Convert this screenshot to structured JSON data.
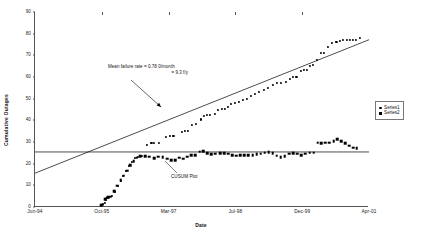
{
  "chart_data": {
    "type": "scatter",
    "title": "",
    "xlabel": "Date",
    "ylabel": "Cumulative Outages",
    "ylim": [
      0,
      90
    ],
    "yticks": [
      0,
      10,
      20,
      30,
      40,
      50,
      60,
      70,
      80,
      90
    ],
    "xticks": [
      "Jun-94",
      "Oct-95",
      "Mar-97",
      "Jul-98",
      "Dec-99",
      "Apr-01"
    ],
    "xlim_months": [
      0,
      82
    ],
    "grid": false,
    "legend_position": "right",
    "legend": [
      "Series1",
      "Series2"
    ],
    "annotations": [
      {
        "name": "mean-failure-rate",
        "line1": "Mean failure rate = 0.78 0/month",
        "line2": "= 9.3 f/y",
        "arrow_from": [
          130,
          80
        ],
        "arrow_to": [
          160,
          107
        ]
      },
      {
        "name": "cusum-plot-label",
        "line1": "CUSUM Plot",
        "leader_from": [
          176,
          173
        ],
        "leader_to": [
          164,
          161
        ]
      }
    ],
    "series": [
      {
        "name": "Series1",
        "marker": "dot",
        "color": "#000000",
        "points": [
          [
            16.3,
            0.8
          ],
          [
            16.6,
            1.2
          ],
          [
            17.1,
            2.0
          ],
          [
            17.4,
            3.4
          ],
          [
            17.8,
            4.0
          ],
          [
            18.2,
            4.6
          ],
          [
            18.9,
            5.2
          ],
          [
            19.6,
            7.0
          ],
          [
            20.3,
            9.8
          ],
          [
            21.0,
            12.2
          ],
          [
            21.7,
            14.4
          ],
          [
            22.4,
            16.6
          ],
          [
            23.1,
            19.0
          ],
          [
            23.8,
            21.0
          ],
          [
            24.5,
            22.6
          ],
          [
            25.2,
            23.3
          ],
          [
            26.3,
            23.6
          ],
          [
            27.4,
            28.6
          ],
          [
            28.6,
            29.5
          ],
          [
            29.3,
            29.6
          ],
          [
            30.4,
            29.7
          ],
          [
            32.1,
            32.3
          ],
          [
            33.2,
            32.6
          ],
          [
            34.0,
            32.7
          ],
          [
            36.0,
            34.8
          ],
          [
            36.8,
            35.2
          ],
          [
            37.5,
            35.3
          ],
          [
            38.5,
            38.0
          ],
          [
            39.6,
            38.5
          ],
          [
            40.8,
            40.4
          ],
          [
            41.5,
            42.0
          ],
          [
            42.2,
            42.3
          ],
          [
            43.0,
            42.5
          ],
          [
            44.1,
            43.0
          ],
          [
            45.0,
            44.6
          ],
          [
            45.8,
            45.1
          ],
          [
            46.6,
            45.4
          ],
          [
            47.4,
            46.0
          ],
          [
            48.2,
            47.5
          ],
          [
            49.0,
            48.0
          ],
          [
            50.0,
            48.3
          ],
          [
            51.0,
            49.4
          ],
          [
            52.1,
            50.0
          ],
          [
            53.0,
            51.2
          ],
          [
            54.0,
            52.0
          ],
          [
            55.0,
            53.0
          ],
          [
            56.2,
            54.0
          ],
          [
            57.3,
            55.0
          ],
          [
            58.4,
            56.3
          ],
          [
            59.5,
            57.2
          ],
          [
            60.4,
            57.4
          ],
          [
            61.5,
            57.6
          ],
          [
            62.6,
            59.2
          ],
          [
            63.4,
            60.0
          ],
          [
            64.2,
            60.2
          ],
          [
            65.3,
            62.8
          ],
          [
            66.0,
            63.1
          ],
          [
            66.8,
            63.3
          ],
          [
            67.6,
            65.3
          ],
          [
            68.3,
            65.6
          ],
          [
            69.2,
            68.0
          ],
          [
            70.2,
            71.0
          ],
          [
            71.0,
            71.2
          ],
          [
            72.0,
            74.0
          ],
          [
            73.0,
            75.8
          ],
          [
            74.0,
            76.0
          ],
          [
            74.8,
            76.8
          ],
          [
            75.6,
            76.9
          ],
          [
            76.5,
            77.0
          ],
          [
            77.3,
            77.0
          ],
          [
            78.1,
            77.0
          ],
          [
            78.9,
            77.1
          ],
          [
            79.8,
            78.0
          ]
        ]
      },
      {
        "name": "Series2",
        "marker": "square",
        "color": "#000000",
        "points": [
          [
            16.3,
            0.9
          ],
          [
            16.6,
            1.1
          ],
          [
            17.2,
            3.6
          ],
          [
            17.6,
            4.3
          ],
          [
            17.9,
            4.5
          ],
          [
            18.6,
            4.7
          ],
          [
            19.4,
            7.2
          ],
          [
            20.2,
            9.9
          ],
          [
            21.0,
            12.3
          ],
          [
            21.8,
            14.5
          ],
          [
            22.6,
            16.8
          ],
          [
            23.4,
            19.2
          ],
          [
            24.2,
            21.2
          ],
          [
            25.0,
            22.8
          ],
          [
            25.9,
            23.4
          ],
          [
            27.0,
            23.5
          ],
          [
            28.1,
            23.2
          ],
          [
            29.2,
            22.5
          ],
          [
            30.3,
            23.2
          ],
          [
            31.4,
            23.1
          ],
          [
            32.4,
            22.2
          ],
          [
            33.4,
            21.6
          ],
          [
            34.4,
            21.7
          ],
          [
            35.4,
            22.7
          ],
          [
            36.4,
            22.3
          ],
          [
            37.4,
            23.3
          ],
          [
            38.4,
            23.9
          ],
          [
            39.4,
            23.9
          ],
          [
            40.4,
            25.5
          ],
          [
            41.3,
            25.7
          ],
          [
            42.3,
            24.7
          ],
          [
            43.3,
            24.5
          ],
          [
            44.3,
            24.6
          ],
          [
            45.4,
            24.8
          ],
          [
            46.4,
            24.7
          ],
          [
            47.4,
            24.6
          ],
          [
            48.4,
            23.8
          ],
          [
            49.4,
            23.6
          ],
          [
            50.4,
            24.0
          ],
          [
            51.4,
            23.8
          ],
          [
            52.4,
            23.9
          ],
          [
            53.4,
            24.0
          ],
          [
            54.4,
            24.3
          ],
          [
            55.4,
            24.6
          ],
          [
            56.4,
            25.0
          ],
          [
            57.4,
            25.2
          ],
          [
            58.4,
            24.9
          ],
          [
            59.3,
            23.6
          ],
          [
            60.3,
            23.0
          ],
          [
            61.3,
            23.4
          ],
          [
            62.4,
            24.6
          ],
          [
            63.4,
            24.9
          ],
          [
            64.4,
            24.6
          ],
          [
            65.4,
            23.8
          ],
          [
            66.4,
            24.6
          ],
          [
            67.4,
            25.0
          ],
          [
            68.4,
            25.1
          ],
          [
            69.4,
            29.7
          ],
          [
            70.3,
            29.4
          ],
          [
            71.3,
            29.6
          ],
          [
            72.3,
            29.7
          ],
          [
            73.3,
            30.4
          ],
          [
            74.2,
            31.4
          ],
          [
            75.2,
            30.4
          ],
          [
            76.2,
            29.4
          ],
          [
            77.2,
            28.3
          ],
          [
            78.1,
            27.3
          ],
          [
            79.0,
            27.2
          ]
        ]
      }
    ],
    "reference_lines": [
      {
        "name": "trend-line",
        "orientation": "diagonal",
        "from": [
          0,
          15.6
        ],
        "to": [
          82,
          77.2
        ],
        "color": "#000000"
      },
      {
        "name": "mean-line",
        "orientation": "horizontal",
        "value": 25.4,
        "color": "#000000"
      }
    ]
  }
}
